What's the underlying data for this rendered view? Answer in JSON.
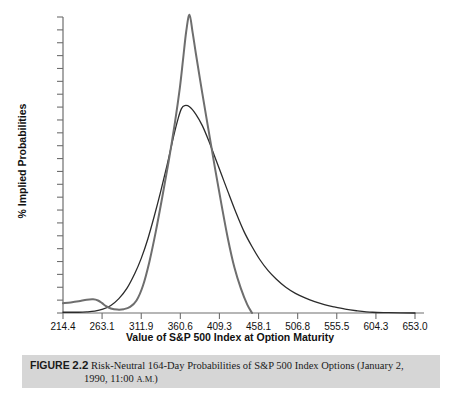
{
  "figure": {
    "label": "FIGURE",
    "number": "2.2",
    "caption_line1": "Risk-Neutral 164-Day Probabilities of S&P 500 Index Options (January 2,",
    "caption_line2_prefix": "1990, 11:00 ",
    "caption_line2_ampm": "A.M.",
    "caption_line2_suffix": ")",
    "caption_full": "FIGURE 2.2 Risk-Neutral 164-Day Probabilities of S&P 500 Index Options (January 2, 1990, 11:00 A.M.)"
  },
  "chart_data": {
    "type": "line",
    "title": "",
    "xlabel": "Value of S&P 500 Index at Option Maturity",
    "ylabel": "% Implied Probabilities",
    "xlim": [
      214.4,
      653.0
    ],
    "ylim": [
      0.0,
      7.82
    ],
    "grid": false,
    "legend": "none",
    "xticks": [
      "214.4",
      "263.1",
      "311.9",
      "360.6",
      "409.3",
      "458.1",
      "506.8",
      "555.5",
      "604.3",
      "653.0"
    ],
    "xtick_values": [
      214.4,
      263.1,
      311.9,
      360.6,
      409.3,
      458.1,
      506.8,
      555.5,
      604.3,
      653.0
    ],
    "yticks": [
      "0.00",
      "0.34",
      "0.68",
      "1.02",
      "1.36",
      "1.70",
      "2.04",
      "2.38",
      "2.72",
      "3.06",
      "3.40",
      "3.74",
      "4.08",
      "4.42",
      "4.76",
      "5.10",
      "5.44",
      "5.78",
      "6.12",
      "6.46",
      "6.80",
      "7.14",
      "7.48",
      "7.82"
    ],
    "ytick_values": [
      0.0,
      0.34,
      0.68,
      1.02,
      1.36,
      1.7,
      2.04,
      2.38,
      2.72,
      3.06,
      3.4,
      3.74,
      4.08,
      4.42,
      4.76,
      5.1,
      5.44,
      5.78,
      6.12,
      6.46,
      6.8,
      7.14,
      7.48,
      7.82
    ],
    "series": [
      {
        "name": "smooth-implied-distribution",
        "color": "#2b2b2b",
        "width": 1.3,
        "x": [
          214.4,
          224.0,
          234.0,
          244.0,
          254.0,
          264.0,
          274.0,
          284.0,
          294.0,
          304.0,
          312.0,
          320.0,
          328.0,
          336.0,
          344.0,
          352.0,
          358.0,
          362.0,
          366.0,
          372.0,
          380.0,
          388.0,
          396.0,
          404.0,
          412.0,
          420.0,
          430.0,
          440.0,
          450.0,
          460.0,
          470.0,
          480.0,
          492.0,
          504.0,
          516.0,
          528.0,
          540.0,
          552.0,
          566.0,
          580.0,
          600.0,
          620.0,
          653.0
        ],
        "y": [
          0.02,
          0.02,
          0.02,
          0.03,
          0.05,
          0.1,
          0.2,
          0.38,
          0.65,
          1.05,
          1.45,
          1.95,
          2.55,
          3.2,
          3.9,
          4.65,
          5.15,
          5.4,
          5.48,
          5.45,
          5.25,
          4.95,
          4.55,
          4.1,
          3.65,
          3.2,
          2.65,
          2.15,
          1.75,
          1.4,
          1.12,
          0.9,
          0.68,
          0.52,
          0.4,
          0.3,
          0.22,
          0.16,
          0.1,
          0.06,
          0.02,
          0.01,
          0.0
        ]
      },
      {
        "name": "lognormal-implied-distribution",
        "color": "#6e6e6e",
        "width": 2.0,
        "x": [
          214.4,
          224.0,
          234.0,
          244.0,
          252.0,
          258.0,
          263.1,
          268.0,
          274.0,
          282.0,
          290.0,
          298.0,
          306.0,
          314.0,
          322.0,
          330.0,
          338.0,
          346.0,
          354.0,
          360.0,
          364.0,
          368.0,
          372.0,
          376.0,
          380.0,
          388.0,
          396.0,
          404.0,
          412.0,
          420.0,
          428.0,
          436.0,
          444.0,
          450.0
        ],
        "y": [
          0.26,
          0.28,
          0.31,
          0.35,
          0.36,
          0.33,
          0.26,
          0.18,
          0.12,
          0.09,
          0.1,
          0.16,
          0.33,
          0.72,
          1.35,
          2.15,
          3.05,
          4.0,
          5.05,
          5.95,
          6.7,
          7.45,
          7.88,
          7.4,
          6.85,
          5.8,
          4.8,
          3.8,
          2.85,
          1.95,
          1.2,
          0.65,
          0.22,
          0.0
        ]
      }
    ]
  }
}
